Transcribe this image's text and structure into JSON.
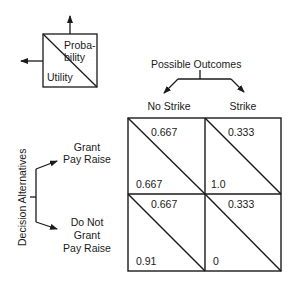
{
  "legend": {
    "probability_label": "Proba-\nbility",
    "utility_label": "Utility"
  },
  "outcomes_header": "Possible Outcomes",
  "outcomes": [
    "No Strike",
    "Strike"
  ],
  "alternatives_header": "Decision Alternatives",
  "alternatives": [
    "Grant\nPay Raise",
    "Do Not\nGrant\nPay Raise"
  ],
  "cells": [
    [
      {
        "probability": "0.667",
        "utility": "0.667"
      },
      {
        "probability": "0.333",
        "utility": "1.0"
      }
    ],
    [
      {
        "probability": "0.667",
        "utility": "0.91"
      },
      {
        "probability": "0.333",
        "utility": "0"
      }
    ]
  ]
}
